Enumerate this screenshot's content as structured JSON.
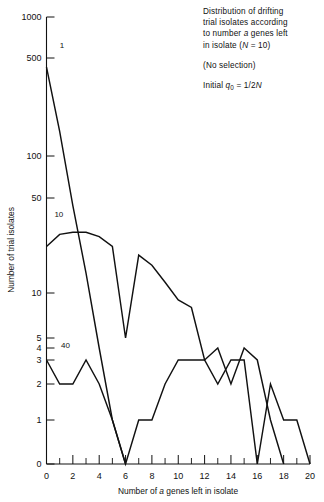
{
  "caption": {
    "paragraphs": [
      "Distribution of drifting trial isolates according to number a genes left in isolate (N = 10)",
      "(No selection)",
      "Initial q0 = 1/2N"
    ],
    "line1": "Distribution of drifting",
    "line2": "trial isolates according",
    "line3_pre": "to number ",
    "line3_ital": "a",
    "line3_post": " genes left",
    "line4_pre": "in isolate (",
    "line4_ital": "N",
    "line4_post": " = 10)",
    "no_selection": "(No selection)",
    "initial_pre": "Initial ",
    "initial_q": "q",
    "initial_sub": "0",
    "initial_eq": " = 1/2",
    "initial_N": "N"
  },
  "chart_data": {
    "type": "line",
    "title": "Distribution of drifting trial isolates according to number a genes left in isolate (N = 10)",
    "xlabel": "Number of a genes left in isolate",
    "ylabel": "Number of trial isolates",
    "xlim": [
      0,
      20
    ],
    "ylim": [
      0,
      1000
    ],
    "yscale": "log-linear hybrid",
    "grid": false,
    "legend": "inline series labels",
    "x_ticks_major": [
      0,
      2,
      4,
      6,
      8,
      10,
      12,
      14,
      16,
      18,
      20
    ],
    "x_ticks_minor": [
      1,
      3,
      5,
      7,
      9,
      11,
      13,
      15,
      17,
      19
    ],
    "y_ticks": [
      0,
      1,
      2,
      3,
      4,
      5,
      10,
      50,
      100,
      500,
      1000
    ],
    "y_tick_labels": [
      "0",
      "1",
      "2",
      "3",
      "4",
      "5",
      "10",
      "50",
      "100",
      "500",
      "1000"
    ],
    "x": [
      0,
      1,
      2,
      3,
      4,
      5,
      6,
      7,
      8,
      9,
      10,
      11,
      12,
      13,
      14,
      15,
      16,
      17,
      18,
      19,
      20
    ],
    "series": [
      {
        "name": "1",
        "label": "1",
        "label_x": 1.0,
        "label_y": 620,
        "values": [
          430,
          150,
          44,
          14,
          4,
          1,
          0,
          null,
          null,
          null,
          null,
          null,
          null,
          null,
          null,
          null,
          null,
          null,
          null,
          null,
          null
        ]
      },
      {
        "name": "10",
        "label": "10",
        "label_x": 0.6,
        "label_y": 38,
        "values": [
          22,
          27,
          28,
          28,
          26,
          22,
          5,
          19,
          16,
          12,
          9,
          8,
          3,
          4,
          2,
          4,
          3,
          1,
          0,
          null,
          null
        ]
      },
      {
        "name": "40",
        "label": "40",
        "label_x": 1.1,
        "label_y": 4.3,
        "values": [
          3,
          2,
          2,
          3,
          2,
          1,
          0,
          1,
          1,
          2,
          3,
          3,
          3,
          2,
          3,
          3,
          0,
          2,
          1,
          1,
          0
        ]
      }
    ]
  },
  "axis": {
    "y_title": "Number of trial isolates",
    "x_title_pre": "Number of ",
    "x_title_ital": "a",
    "x_title_post": " genes left in isolate"
  }
}
